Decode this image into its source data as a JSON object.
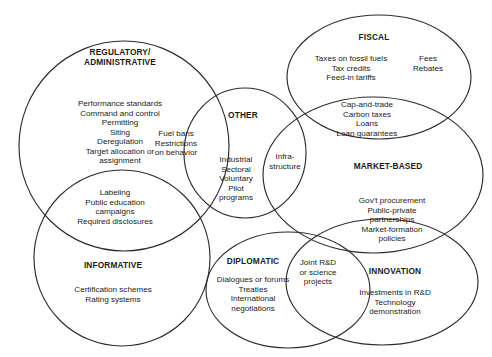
{
  "diagram": {
    "kind": "venn-euler-diagram",
    "stroke_color": "#2b2b2b",
    "background_color": "#ffffff",
    "text_color": "#1a1a1a",
    "categories": [
      {
        "id": "regulatory",
        "title": "REGULATORY/\nADMINISTRATIVE",
        "items": "Performance standards\nCommand and control\nPermitting\nSiting\nDeregulation\nTarget allocation or\nassignment"
      },
      {
        "id": "fiscal",
        "title": "FISCAL",
        "items": "Taxes on fossil fuels\nTax credits\nFeed-in tariffs",
        "items_secondary": "Fees\nRebates"
      },
      {
        "id": "other",
        "title": "OTHER",
        "items": "Industrial\nSectoral\nVoluntary\nPilot\nprograms"
      },
      {
        "id": "market-based",
        "title": "MARKET-BASED",
        "items": ""
      },
      {
        "id": "informative",
        "title": "INFORMATIVE",
        "items": "Certification schemes\nRating systems"
      },
      {
        "id": "diplomatic",
        "title": "DIPLOMATIC",
        "items": "Dialogues or forums\nTreaties\nInternational\nnegotiations"
      },
      {
        "id": "innovation",
        "title": "INNOVATION",
        "items": "Investments in R&D\nTechnology\ndemonstration"
      }
    ],
    "overlaps": [
      {
        "id": "regulatory-other",
        "between": "REGULATORY/ADMINISTRATIVE + OTHER",
        "items": "Fuel bans\nRestrictions\non behavior"
      },
      {
        "id": "regulatory-informative",
        "between": "REGULATORY/ADMINISTRATIVE + INFORMATIVE",
        "items": "Labeling\nPublic education\ncampaigns\nRequired disclosures"
      },
      {
        "id": "other-market-based",
        "between": "OTHER + MARKET-BASED",
        "items": "Infra-\nstructure"
      },
      {
        "id": "fiscal-market-based",
        "between": "FISCAL + MARKET-BASED",
        "items": "Cap-and-trade\nCarbon taxes\nLoans\nLoan guarantees"
      },
      {
        "id": "market-based-innovation",
        "between": "MARKET-BASED + INNOVATION",
        "items": "Gov't procurement\nPublic-private\npartnerships\nMarket-formation\npolicies"
      },
      {
        "id": "diplomatic-innovation",
        "between": "DIPLOMATIC + INNOVATION",
        "items": "Joint R&D\nor science\nprojects"
      }
    ]
  }
}
